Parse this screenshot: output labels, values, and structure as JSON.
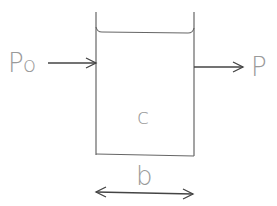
{
  "diagram": {
    "type": "container-flow",
    "labels": {
      "inlet": "P",
      "inlet_subscript": "o",
      "outlet": "P",
      "content": "c",
      "width": "b"
    },
    "elements": {
      "container": {
        "left": 96,
        "right": 194,
        "top": 12,
        "bottom": 155,
        "liquid_level": 32
      },
      "inlet_arrow": {
        "x1": 48,
        "x2": 96,
        "y": 63
      },
      "outlet_arrow": {
        "x1": 194,
        "x2": 243,
        "y": 67
      },
      "width_arrow": {
        "x1": 96,
        "x2": 193,
        "y": 193
      }
    },
    "colors": {
      "line": "#555555",
      "label": "#9a9a9a",
      "background": "#ffffff"
    }
  }
}
